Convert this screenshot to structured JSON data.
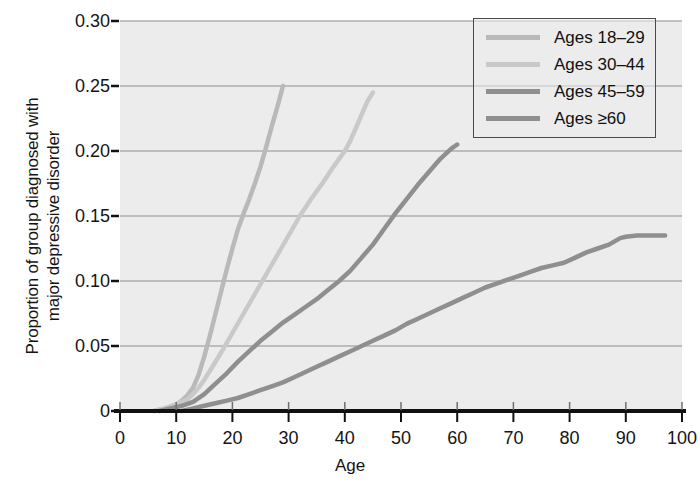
{
  "chart_data": {
    "type": "line",
    "title": "",
    "subtitle": "",
    "xlabel": "Age",
    "ylabel": "Proportion of group diagnosed with major depressive disorder",
    "ylabel_line1": "Proportion of group diagnosed with",
    "ylabel_line2": "major depressive disorder",
    "xlim": [
      0,
      100
    ],
    "ylim": [
      0,
      0.3
    ],
    "xticks": [
      0,
      10,
      20,
      30,
      40,
      50,
      60,
      70,
      80,
      90,
      100
    ],
    "xtick_labels": [
      "0",
      "10",
      "20",
      "30",
      "40",
      "50",
      "60",
      "70",
      "80",
      "90",
      "100"
    ],
    "yticks": [
      0,
      0.05,
      0.1,
      0.15,
      0.2,
      0.25,
      0.3
    ],
    "ytick_labels": [
      "0",
      "0.05",
      "0.10",
      "0.15",
      "0.20",
      "0.25",
      "0.30"
    ],
    "grid": "horizontal",
    "legend_position": "top-right",
    "plot_bg": "#ececec",
    "grid_color": "#8d8d8d",
    "axis_color": "#111111",
    "series": [
      {
        "name": "Ages 18–29",
        "color": "#b9b9b9",
        "x": [
          6,
          8,
          10,
          11,
          12,
          13,
          14,
          15,
          16,
          17,
          18,
          19,
          20,
          21,
          22,
          23,
          24,
          25,
          26,
          27,
          28,
          29
        ],
        "values": [
          0.0,
          0.002,
          0.005,
          0.008,
          0.012,
          0.018,
          0.028,
          0.042,
          0.058,
          0.075,
          0.092,
          0.109,
          0.125,
          0.14,
          0.152,
          0.163,
          0.175,
          0.188,
          0.203,
          0.219,
          0.234,
          0.25
        ]
      },
      {
        "name": "Ages 30–44",
        "color": "#c9c9c9",
        "x": [
          6,
          8,
          10,
          12,
          13,
          14,
          15,
          16,
          18,
          20,
          22,
          24,
          26,
          28,
          30,
          32,
          34,
          36,
          38,
          40,
          41,
          42,
          43,
          44,
          45
        ],
        "values": [
          0.0,
          0.002,
          0.005,
          0.009,
          0.013,
          0.018,
          0.024,
          0.031,
          0.045,
          0.06,
          0.075,
          0.09,
          0.105,
          0.12,
          0.135,
          0.15,
          0.163,
          0.175,
          0.188,
          0.2,
          0.208,
          0.218,
          0.228,
          0.238,
          0.245
        ]
      },
      {
        "name": "Ages 45–59",
        "color": "#8f8f8f",
        "x": [
          7,
          9,
          11,
          13,
          15,
          17,
          19,
          21,
          23,
          25,
          27,
          29,
          31,
          33,
          35,
          37,
          39,
          41,
          43,
          45,
          47,
          49,
          51,
          53,
          55,
          57,
          59,
          60
        ],
        "values": [
          0.0,
          0.002,
          0.004,
          0.007,
          0.013,
          0.021,
          0.029,
          0.038,
          0.046,
          0.054,
          0.061,
          0.068,
          0.074,
          0.08,
          0.086,
          0.093,
          0.1,
          0.108,
          0.118,
          0.128,
          0.14,
          0.152,
          0.163,
          0.174,
          0.184,
          0.194,
          0.202,
          0.205
        ]
      },
      {
        "name": "Ages ≥60",
        "color": "#8f8f8f",
        "x": [
          11,
          13,
          15,
          17,
          19,
          21,
          23,
          25,
          27,
          29,
          31,
          33,
          35,
          37,
          39,
          41,
          43,
          45,
          47,
          49,
          51,
          53,
          55,
          57,
          59,
          61,
          63,
          65,
          67,
          69,
          71,
          73,
          75,
          77,
          79,
          81,
          83,
          85,
          87,
          89,
          90,
          92,
          95,
          97
        ],
        "values": [
          0.0,
          0.002,
          0.004,
          0.006,
          0.008,
          0.01,
          0.013,
          0.016,
          0.019,
          0.022,
          0.026,
          0.03,
          0.034,
          0.038,
          0.042,
          0.046,
          0.05,
          0.054,
          0.058,
          0.062,
          0.067,
          0.071,
          0.075,
          0.079,
          0.083,
          0.087,
          0.091,
          0.095,
          0.098,
          0.101,
          0.104,
          0.107,
          0.11,
          0.112,
          0.114,
          0.118,
          0.122,
          0.125,
          0.128,
          0.133,
          0.134,
          0.135,
          0.135,
          0.135
        ]
      }
    ]
  },
  "legend": {
    "items": [
      {
        "label": "Ages 18–29",
        "color": "#b9b9b9"
      },
      {
        "label": "Ages 30–44",
        "color": "#c9c9c9"
      },
      {
        "label": "Ages 45–59",
        "color": "#8f8f8f"
      },
      {
        "label": "Ages ≥60",
        "color": "#8f8f8f"
      }
    ]
  }
}
